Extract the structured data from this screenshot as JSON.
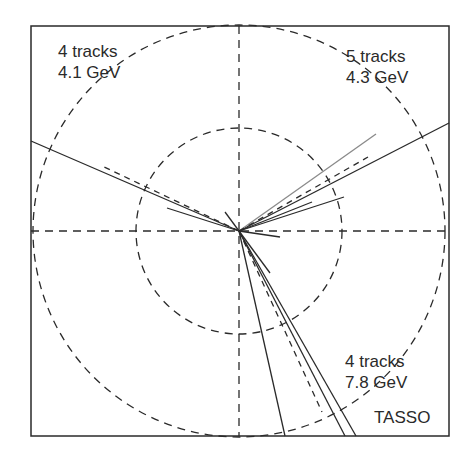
{
  "figure": {
    "detector_label": "TASSO",
    "jets": [
      {
        "tracks_label": "4 tracks",
        "energy_label": "4.1 GeV",
        "position": "top-left"
      },
      {
        "tracks_label": "5 tracks",
        "energy_label": "4.3 GeV",
        "position": "top-right"
      },
      {
        "tracks_label": "4 tracks",
        "energy_label": "7.8 GeV",
        "position": "bottom-right"
      }
    ]
  },
  "colors": {
    "line": "#2a2a2a",
    "light_line": "#8a8a8a",
    "background": "#ffffff"
  }
}
